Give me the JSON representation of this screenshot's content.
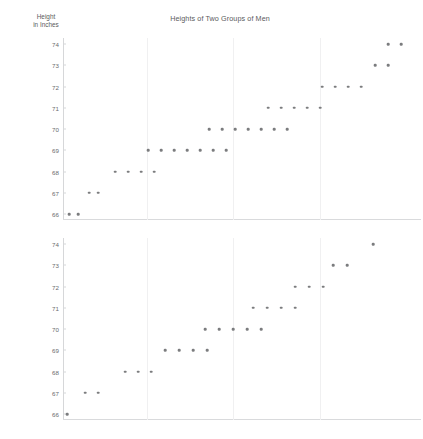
{
  "chart_data": {
    "type": "scatter",
    "title": "Heights of Two Groups of Men",
    "ylabel_line1": "Height",
    "ylabel_line2": "in Inches",
    "xlabel": "",
    "ylim": [
      66,
      74
    ],
    "yticks": [
      66,
      67,
      68,
      69,
      70,
      71,
      72,
      73,
      74
    ],
    "grid": "vertical-only",
    "legend": "none",
    "dot_color": "#7b7c7e",
    "axis_color": "#d6d7d9",
    "grid_color": "#f0f0f1",
    "text_color": "#5a5b5d",
    "panels": [
      {
        "name": "group-1",
        "categories": [
          66,
          67,
          68,
          69,
          70,
          71,
          72,
          73,
          74
        ],
        "counts": [
          2,
          2,
          4,
          7,
          7,
          5,
          4,
          2,
          2
        ],
        "total": 35,
        "rows": [
          {
            "height": 66,
            "count": 2,
            "x_start": 6,
            "x_step": 9
          },
          {
            "height": 67,
            "count": 2,
            "x_start": 26,
            "x_step": 9
          },
          {
            "height": 68,
            "count": 4,
            "x_start": 52,
            "x_step": 13
          },
          {
            "height": 69,
            "count": 7,
            "x_start": 85,
            "x_step": 13
          },
          {
            "height": 70,
            "count": 7,
            "x_start": 146,
            "x_step": 13
          },
          {
            "height": 71,
            "count": 5,
            "x_start": 205,
            "x_step": 13
          },
          {
            "height": 72,
            "count": 4,
            "x_start": 259,
            "x_step": 13
          },
          {
            "height": 73,
            "count": 2,
            "x_start": 312,
            "x_step": 13
          },
          {
            "height": 74,
            "count": 2,
            "x_start": 325,
            "x_step": 13
          }
        ]
      },
      {
        "name": "group-2",
        "categories": [
          66,
          67,
          68,
          69,
          70,
          71,
          72,
          73,
          74
        ],
        "counts": [
          1,
          2,
          3,
          4,
          5,
          4,
          3,
          2,
          1
        ],
        "total": 25,
        "rows": [
          {
            "height": 66,
            "count": 1,
            "x_start": 4,
            "x_step": 13
          },
          {
            "height": 67,
            "count": 2,
            "x_start": 22,
            "x_step": 13
          },
          {
            "height": 68,
            "count": 3,
            "x_start": 62,
            "x_step": 13
          },
          {
            "height": 69,
            "count": 4,
            "x_start": 102,
            "x_step": 14
          },
          {
            "height": 70,
            "count": 5,
            "x_start": 142,
            "x_step": 14
          },
          {
            "height": 71,
            "count": 4,
            "x_start": 190,
            "x_step": 14
          },
          {
            "height": 72,
            "count": 3,
            "x_start": 232,
            "x_step": 14
          },
          {
            "height": 73,
            "count": 2,
            "x_start": 270,
            "x_step": 14
          },
          {
            "height": 74,
            "count": 1,
            "x_start": 310,
            "x_step": 14
          }
        ]
      }
    ],
    "vertical_gridlines_x": [
      84,
      170,
      257
    ]
  }
}
